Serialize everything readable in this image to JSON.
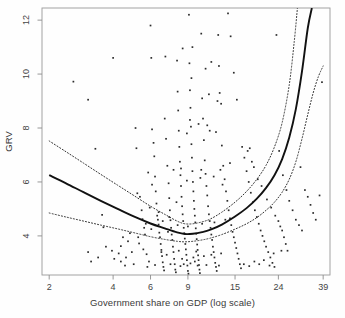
{
  "chart_data": {
    "type": "scatter",
    "title": "",
    "subtitle": "",
    "xlabel": "Government share on GDP (log scale)",
    "ylabel": "GRV",
    "x_scale": "log",
    "grid": false,
    "legend": "none",
    "xticks": [
      2,
      4,
      6,
      9,
      15,
      24,
      39
    ],
    "xtick_labels": [
      "2",
      "4",
      "6",
      "9",
      "15",
      "24",
      "39"
    ],
    "yticks": [
      4,
      6,
      8,
      10,
      12
    ],
    "ytick_labels": [
      "4",
      "6",
      "8",
      "10",
      "12"
    ],
    "xlim": [
      1.85,
      42.0
    ],
    "ylim": [
      2.55,
      12.45
    ],
    "point_marker": "small-dark-square",
    "point_color": "#2b2b2b",
    "fit_line": {
      "name": "smoothed fit",
      "style": "solid",
      "color": "#111111",
      "x": [
        2.0,
        2.4,
        2.9,
        3.5,
        4.2,
        5.0,
        6.0,
        7.0,
        8.0,
        8.7,
        9.5,
        10.5,
        11.5,
        13.0,
        15.0,
        17.0,
        19.0,
        21.0,
        23.0,
        25.0,
        27.0,
        29.0,
        31.0,
        33.0,
        34.5
      ],
      "y": [
        6.25,
        5.95,
        5.62,
        5.3,
        5.0,
        4.72,
        4.46,
        4.28,
        4.13,
        4.07,
        4.08,
        4.14,
        4.23,
        4.42,
        4.72,
        5.03,
        5.38,
        5.78,
        6.25,
        6.85,
        7.65,
        8.7,
        10.1,
        11.7,
        12.45
      ]
    },
    "confidence_band_upper": {
      "name": "upper confidence bound",
      "style": "dotted",
      "color": "#333333",
      "x": [
        2.0,
        2.4,
        2.9,
        3.5,
        4.2,
        5.0,
        6.0,
        7.0,
        8.0,
        8.7,
        9.5,
        10.5,
        11.5,
        13.0,
        15.0,
        17.0,
        19.0,
        21.0,
        23.0,
        25.0,
        27.0,
        28.5,
        29.5
      ],
      "y": [
        7.52,
        7.12,
        6.7,
        6.28,
        5.88,
        5.5,
        5.1,
        4.8,
        4.55,
        4.45,
        4.45,
        4.52,
        4.63,
        4.88,
        5.25,
        5.65,
        6.1,
        6.62,
        7.3,
        8.2,
        9.6,
        11.2,
        12.45
      ]
    },
    "confidence_band_lower": {
      "name": "lower confidence bound",
      "style": "dotted",
      "color": "#333333",
      "x": [
        2.0,
        2.4,
        2.9,
        3.5,
        4.2,
        5.0,
        6.0,
        7.0,
        8.0,
        8.7,
        9.5,
        10.5,
        11.5,
        13.0,
        15.0,
        17.0,
        19.0,
        21.0,
        23.0,
        25.0,
        27.0,
        29.0,
        31.0,
        33.0,
        35.0,
        37.0,
        39.0
      ],
      "y": [
        4.85,
        4.7,
        4.55,
        4.4,
        4.26,
        4.12,
        3.97,
        3.87,
        3.8,
        3.78,
        3.8,
        3.85,
        3.92,
        4.05,
        4.25,
        4.45,
        4.68,
        4.95,
        5.25,
        5.62,
        6.1,
        6.75,
        7.6,
        8.5,
        9.3,
        9.9,
        10.3
      ]
    },
    "points": [
      [
        2.6,
        9.72
      ],
      [
        3.05,
        9.05
      ],
      [
        3.3,
        7.23
      ],
      [
        3.55,
        4.78
      ],
      [
        3.6,
        4.32
      ],
      [
        3.05,
        3.4
      ],
      [
        3.4,
        3.2
      ],
      [
        3.15,
        3.05
      ],
      [
        3.7,
        3.6
      ],
      [
        3.95,
        3.45
      ],
      [
        4.0,
        10.6
      ],
      [
        4.25,
        3.35
      ],
      [
        4.35,
        3.05
      ],
      [
        4.6,
        3.2
      ],
      [
        4.7,
        3.8
      ],
      [
        4.9,
        3.4
      ],
      [
        4.55,
        2.9
      ],
      [
        5.0,
        2.95
      ],
      [
        4.35,
        3.62
      ],
      [
        4.05,
        3.15
      ],
      [
        5.1,
        8.0
      ],
      [
        5.15,
        7.25
      ],
      [
        5.2,
        5.58
      ],
      [
        5.35,
        5.45
      ],
      [
        5.45,
        4.95
      ],
      [
        5.5,
        4.62
      ],
      [
        5.6,
        4.3
      ],
      [
        5.65,
        4.05
      ],
      [
        5.3,
        3.72
      ],
      [
        5.55,
        3.5
      ],
      [
        5.75,
        3.32
      ],
      [
        5.9,
        3.05
      ],
      [
        5.8,
        2.85
      ],
      [
        6.0,
        11.8
      ],
      [
        6.05,
        10.6
      ],
      [
        6.1,
        7.95
      ],
      [
        6.2,
        7.45
      ],
      [
        6.25,
        6.95
      ],
      [
        6.3,
        6.2
      ],
      [
        6.35,
        5.65
      ],
      [
        6.4,
        5.2
      ],
      [
        6.45,
        4.75
      ],
      [
        6.5,
        4.6
      ],
      [
        6.55,
        4.42
      ],
      [
        6.6,
        4.12
      ],
      [
        6.65,
        3.95
      ],
      [
        6.7,
        3.7
      ],
      [
        6.75,
        3.48
      ],
      [
        6.8,
        3.25
      ],
      [
        6.85,
        3.02
      ],
      [
        6.9,
        2.85
      ],
      [
        6.95,
        2.72
      ],
      [
        7.0,
        8.35
      ],
      [
        7.1,
        7.6
      ],
      [
        7.2,
        6.6
      ],
      [
        7.3,
        5.95
      ],
      [
        7.35,
        5.4
      ],
      [
        7.4,
        4.95
      ],
      [
        7.45,
        4.58
      ],
      [
        7.5,
        4.3
      ],
      [
        7.55,
        4.05
      ],
      [
        7.6,
        3.85
      ],
      [
        7.65,
        3.6
      ],
      [
        7.7,
        3.4
      ],
      [
        7.75,
        3.15
      ],
      [
        7.8,
        2.95
      ],
      [
        7.85,
        2.75
      ],
      [
        7.9,
        2.65
      ],
      [
        8.0,
        10.5
      ],
      [
        8.05,
        9.35
      ],
      [
        8.1,
        8.65
      ],
      [
        8.15,
        7.9
      ],
      [
        8.2,
        7.3
      ],
      [
        8.25,
        6.75
      ],
      [
        8.3,
        6.25
      ],
      [
        8.35,
        5.85
      ],
      [
        8.4,
        5.45
      ],
      [
        8.45,
        5.1
      ],
      [
        8.5,
        4.8
      ],
      [
        8.55,
        4.55
      ],
      [
        8.6,
        4.3
      ],
      [
        8.65,
        4.1
      ],
      [
        8.7,
        3.9
      ],
      [
        8.75,
        3.7
      ],
      [
        8.8,
        3.5
      ],
      [
        8.85,
        3.3
      ],
      [
        8.9,
        3.1
      ],
      [
        8.95,
        2.9
      ],
      [
        9.0,
        2.7
      ],
      [
        9.05,
        2.6
      ],
      [
        9.1,
        12.2
      ],
      [
        9.15,
        10.4
      ],
      [
        9.2,
        9.4
      ],
      [
        9.25,
        8.75
      ],
      [
        9.3,
        8.05
      ],
      [
        9.35,
        7.4
      ],
      [
        9.4,
        6.9
      ],
      [
        9.45,
        6.4
      ],
      [
        9.5,
        6.0
      ],
      [
        9.55,
        5.65
      ],
      [
        9.6,
        5.3
      ],
      [
        9.65,
        5.0
      ],
      [
        9.7,
        4.75
      ],
      [
        9.75,
        4.5
      ],
      [
        9.8,
        4.28
      ],
      [
        9.85,
        4.08
      ],
      [
        9.9,
        3.88
      ],
      [
        9.95,
        3.68
      ],
      [
        10.0,
        3.48
      ],
      [
        10.05,
        3.28
      ],
      [
        10.1,
        3.1
      ],
      [
        10.15,
        2.92
      ],
      [
        10.2,
        2.75
      ],
      [
        10.25,
        2.62
      ],
      [
        10.4,
        11.5
      ],
      [
        10.5,
        9.1
      ],
      [
        10.6,
        8.35
      ],
      [
        10.7,
        7.55
      ],
      [
        10.8,
        6.8
      ],
      [
        10.9,
        6.3
      ],
      [
        11.0,
        5.85
      ],
      [
        11.1,
        5.5
      ],
      [
        11.2,
        5.1
      ],
      [
        11.3,
        4.8
      ],
      [
        11.4,
        4.55
      ],
      [
        11.5,
        4.3
      ],
      [
        11.6,
        4.05
      ],
      [
        11.7,
        3.85
      ],
      [
        11.8,
        3.6
      ],
      [
        11.9,
        3.4
      ],
      [
        12.0,
        3.2
      ],
      [
        12.1,
        3.0
      ],
      [
        12.2,
        2.85
      ],
      [
        12.3,
        2.7
      ],
      [
        12.5,
        11.45
      ],
      [
        12.7,
        9.3
      ],
      [
        12.9,
        8.9
      ],
      [
        13.0,
        7.35
      ],
      [
        13.2,
        6.6
      ],
      [
        13.4,
        6.1
      ],
      [
        13.6,
        5.65
      ],
      [
        13.8,
        5.3
      ],
      [
        14.0,
        4.95
      ],
      [
        14.2,
        4.65
      ],
      [
        14.4,
        4.4
      ],
      [
        14.6,
        4.15
      ],
      [
        14.8,
        3.95
      ],
      [
        15.0,
        3.75
      ],
      [
        15.2,
        3.55
      ],
      [
        15.4,
        3.35
      ],
      [
        15.6,
        3.15
      ],
      [
        15.8,
        2.95
      ],
      [
        16.0,
        2.8
      ],
      [
        13.9,
        12.25
      ],
      [
        14.3,
        11.4
      ],
      [
        14.8,
        10.05
      ],
      [
        15.3,
        9.05
      ],
      [
        16.2,
        7.3
      ],
      [
        16.6,
        6.9
      ],
      [
        17.0,
        6.4
      ],
      [
        17.4,
        6.0
      ],
      [
        17.8,
        5.6
      ],
      [
        18.2,
        5.25
      ],
      [
        18.6,
        4.95
      ],
      [
        19.0,
        4.7
      ],
      [
        19.4,
        4.45
      ],
      [
        19.8,
        4.2
      ],
      [
        20.2,
        4.0
      ],
      [
        20.6,
        3.8
      ],
      [
        21.0,
        3.6
      ],
      [
        21.5,
        3.4
      ],
      [
        22.0,
        3.2
      ],
      [
        22.5,
        3.0
      ],
      [
        23.0,
        2.85
      ],
      [
        17.2,
        7.15
      ],
      [
        17.6,
        7.25
      ],
      [
        18.0,
        6.75
      ],
      [
        18.4,
        6.55
      ],
      [
        19.2,
        6.1
      ],
      [
        20.0,
        5.85
      ],
      [
        21.2,
        5.35
      ],
      [
        22.2,
        5.05
      ],
      [
        23.2,
        4.75
      ],
      [
        24.0,
        4.55
      ],
      [
        24.5,
        4.35
      ],
      [
        25.0,
        4.2
      ],
      [
        25.5,
        3.95
      ],
      [
        26.0,
        3.7
      ],
      [
        26.5,
        3.45
      ],
      [
        23.5,
        11.45
      ],
      [
        24.2,
        7.15
      ],
      [
        25.2,
        6.25
      ],
      [
        26.2,
        5.7
      ],
      [
        27.0,
        5.3
      ],
      [
        28.0,
        4.95
      ],
      [
        29.0,
        4.6
      ],
      [
        30.0,
        4.4
      ],
      [
        31.0,
        4.2
      ],
      [
        30.5,
        6.55
      ],
      [
        32.0,
        5.7
      ],
      [
        33.0,
        5.45
      ],
      [
        34.0,
        5.15
      ],
      [
        35.0,
        4.85
      ],
      [
        36.0,
        4.6
      ],
      [
        37.5,
        5.5
      ],
      [
        38.5,
        9.7
      ],
      [
        11.3,
        9.25
      ],
      [
        12.4,
        9.0
      ],
      [
        9.35,
        9.85
      ],
      [
        8.9,
        6.05
      ],
      [
        10.3,
        6.15
      ],
      [
        11.9,
        6.2
      ],
      [
        13.1,
        5.9
      ],
      [
        7.95,
        5.25
      ],
      [
        6.1,
        5.9
      ],
      [
        5.85,
        6.35
      ],
      [
        7.25,
        4.15
      ],
      [
        8.05,
        4.4
      ],
      [
        9.0,
        4.35
      ],
      [
        10.5,
        4.45
      ],
      [
        12.0,
        4.5
      ],
      [
        13.5,
        4.6
      ],
      [
        6.55,
        4.88
      ],
      [
        5.95,
        5.05
      ],
      [
        8.6,
        2.95
      ],
      [
        9.25,
        2.98
      ],
      [
        9.7,
        3.05
      ],
      [
        8.3,
        2.88
      ],
      [
        10.0,
        2.9
      ],
      [
        7.45,
        2.95
      ],
      [
        11.0,
        2.92
      ],
      [
        6.3,
        2.92
      ],
      [
        12.6,
        2.9
      ],
      [
        8.45,
        3.15
      ],
      [
        9.55,
        3.2
      ],
      [
        10.7,
        3.25
      ],
      [
        7.15,
        3.3
      ],
      [
        11.6,
        3.3
      ],
      [
        6.75,
        3.4
      ],
      [
        12.9,
        3.35
      ],
      [
        8.15,
        3.45
      ],
      [
        9.85,
        3.42
      ],
      [
        20.5,
        3.1
      ],
      [
        19.5,
        2.95
      ],
      [
        18.5,
        3.05
      ],
      [
        17.5,
        2.88
      ],
      [
        16.5,
        2.95
      ],
      [
        21.8,
        2.9
      ],
      [
        22.8,
        3.35
      ],
      [
        24.8,
        3.45
      ],
      [
        9.45,
        11.0
      ],
      [
        8.5,
        10.95
      ],
      [
        7.05,
        10.65
      ],
      [
        10.9,
        10.2
      ],
      [
        11.6,
        10.45
      ],
      [
        12.6,
        10.3
      ],
      [
        9.2,
        8.3
      ],
      [
        10.1,
        8.15
      ],
      [
        11.1,
        8.1
      ],
      [
        8.9,
        7.8
      ],
      [
        11.4,
        7.9
      ],
      [
        12.2,
        7.85
      ],
      [
        7.7,
        6.45
      ],
      [
        8.35,
        6.5
      ],
      [
        10.4,
        6.45
      ],
      [
        12.8,
        6.45
      ],
      [
        14.2,
        6.7
      ],
      [
        5.25,
        3.95
      ],
      [
        5.7,
        4.45
      ],
      [
        4.8,
        4.1
      ],
      [
        4.45,
        3.95
      ],
      [
        6.05,
        4.25
      ],
      [
        6.85,
        4.55
      ],
      [
        7.35,
        4.7
      ]
    ]
  },
  "frame": {
    "border_color": "#9a9a9a"
  }
}
